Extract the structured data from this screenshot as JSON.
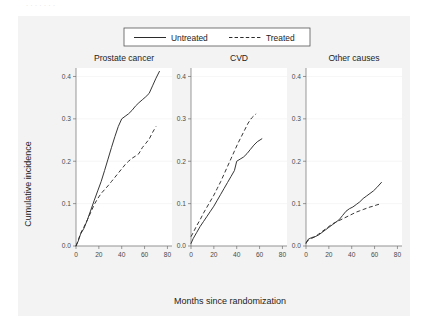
{
  "caption_sliver": ". .   .   .   .      .        .",
  "figure": {
    "background_color": "#f3f3f3",
    "plot_background_color": "#ffffff",
    "line_color": "#2b2b2b",
    "axis_color": "#6f6f6f"
  },
  "legend": {
    "position": "top-center",
    "entries": [
      {
        "label": "Untreated",
        "style": "solid"
      },
      {
        "label": "Treated",
        "style": "dashed"
      }
    ]
  },
  "axes": {
    "xlabel": "Months since randomization",
    "ylabel": "Cumulative incidence",
    "xticks": [
      "0",
      "20",
      "40",
      "60",
      "80"
    ],
    "yticks": [
      "0.0",
      "0.1",
      "0.2",
      "0.3",
      "0.4"
    ]
  },
  "chart_data": {
    "type": "line",
    "title": "",
    "xlabel": "Months since randomization",
    "ylabel": "Cumulative incidence",
    "xlim": [
      0,
      84
    ],
    "ylim": [
      0,
      0.42
    ],
    "xticks": [
      0,
      20,
      40,
      60,
      80
    ],
    "yticks": [
      0.0,
      0.1,
      0.2,
      0.3,
      0.4
    ],
    "grid": false,
    "legend": [
      "Untreated",
      "Treated"
    ],
    "legend_position": "top-center",
    "panels": [
      {
        "title": "Prostate cancer",
        "series": [
          {
            "name": "Untreated",
            "style": "solid",
            "x": [
              0,
              2,
              4,
              7,
              10,
              13,
              16,
              19,
              22,
              25,
              28,
              31,
              34,
              37,
              40,
              43,
              46,
              49,
              52,
              55,
              58,
              61,
              64,
              67,
              70,
              73
            ],
            "y": [
              0.0,
              0.012,
              0.028,
              0.042,
              0.062,
              0.085,
              0.108,
              0.13,
              0.152,
              0.178,
              0.205,
              0.232,
              0.258,
              0.282,
              0.3,
              0.306,
              0.312,
              0.32,
              0.33,
              0.338,
              0.345,
              0.352,
              0.36,
              0.378,
              0.396,
              0.412
            ]
          },
          {
            "name": "Treated",
            "style": "dashed",
            "x": [
              0,
              2,
              4,
              7,
              10,
              13,
              16,
              19,
              22,
              25,
              28,
              31,
              34,
              37,
              40,
              43,
              46,
              49,
              52,
              55,
              58,
              61,
              64,
              67,
              70
            ],
            "y": [
              0.0,
              0.014,
              0.03,
              0.045,
              0.062,
              0.08,
              0.098,
              0.112,
              0.124,
              0.133,
              0.142,
              0.152,
              0.162,
              0.172,
              0.182,
              0.192,
              0.2,
              0.207,
              0.212,
              0.218,
              0.232,
              0.242,
              0.252,
              0.268,
              0.282
            ]
          }
        ]
      },
      {
        "title": "CVD",
        "series": [
          {
            "name": "Untreated",
            "style": "solid",
            "x": [
              0,
              2,
              5,
              8,
              11,
              14,
              17,
              20,
              23,
              26,
              29,
              32,
              35,
              38,
              40,
              43,
              46,
              49,
              52,
              55,
              58,
              62
            ],
            "y": [
              0.006,
              0.018,
              0.032,
              0.046,
              0.058,
              0.07,
              0.082,
              0.094,
              0.108,
              0.122,
              0.136,
              0.15,
              0.164,
              0.178,
              0.2,
              0.205,
              0.21,
              0.218,
              0.228,
              0.238,
              0.246,
              0.253
            ]
          },
          {
            "name": "Treated",
            "style": "dashed",
            "x": [
              0,
              2,
              5,
              8,
              11,
              14,
              17,
              20,
              23,
              26,
              29,
              32,
              35,
              38,
              41,
              44,
              47,
              50,
              53,
              57
            ],
            "y": [
              0.022,
              0.032,
              0.048,
              0.062,
              0.078,
              0.092,
              0.106,
              0.12,
              0.136,
              0.152,
              0.17,
              0.188,
              0.206,
              0.224,
              0.242,
              0.258,
              0.274,
              0.29,
              0.302,
              0.312
            ]
          }
        ]
      },
      {
        "title": "Other causes",
        "series": [
          {
            "name": "Untreated",
            "style": "solid",
            "x": [
              0,
              2,
              5,
              8,
              11,
              14,
              17,
              20,
              23,
              26,
              29,
              32,
              35,
              38,
              41,
              44,
              47,
              50,
              53,
              56,
              59,
              62,
              66
            ],
            "y": [
              0.006,
              0.016,
              0.02,
              0.022,
              0.026,
              0.032,
              0.038,
              0.044,
              0.05,
              0.056,
              0.062,
              0.072,
              0.082,
              0.088,
              0.092,
              0.098,
              0.104,
              0.112,
              0.118,
              0.124,
              0.13,
              0.138,
              0.15
            ]
          },
          {
            "name": "Treated",
            "style": "dashed",
            "x": [
              0,
              2,
              5,
              8,
              11,
              14,
              17,
              20,
              23,
              26,
              29,
              32,
              35,
              38,
              41,
              44,
              47,
              50,
              53,
              56,
              59,
              62,
              66
            ],
            "y": [
              0.008,
              0.014,
              0.018,
              0.022,
              0.028,
              0.034,
              0.04,
              0.046,
              0.052,
              0.056,
              0.06,
              0.064,
              0.068,
              0.072,
              0.076,
              0.08,
              0.083,
              0.086,
              0.089,
              0.092,
              0.094,
              0.097,
              0.1
            ]
          }
        ]
      }
    ]
  }
}
